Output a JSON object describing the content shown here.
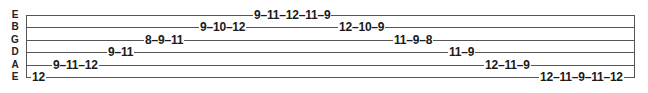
{
  "strings": [
    {
      "name": "E",
      "y": 15
    },
    {
      "name": "B",
      "y": 27
    },
    {
      "name": "G",
      "y": 40
    },
    {
      "name": "D",
      "y": 52
    },
    {
      "name": "A",
      "y": 65
    },
    {
      "name": "E",
      "y": 77
    }
  ],
  "phrases": [
    {
      "string": 5,
      "x": 31,
      "text": "12"
    },
    {
      "string": 4,
      "x": 52,
      "text": "9–11–12"
    },
    {
      "string": 3,
      "x": 107,
      "text": "9–11"
    },
    {
      "string": 2,
      "x": 144,
      "text": "8–9–11"
    },
    {
      "string": 1,
      "x": 199,
      "text": "9–10–12"
    },
    {
      "string": 0,
      "x": 253,
      "text": "9–11–12–11–9"
    },
    {
      "string": 1,
      "x": 338,
      "text": "12–10–9"
    },
    {
      "string": 2,
      "x": 393,
      "text": "11–9–8"
    },
    {
      "string": 3,
      "x": 448,
      "text": "11–9"
    },
    {
      "string": 4,
      "x": 484,
      "text": "12–11–9"
    },
    {
      "string": 5,
      "x": 539,
      "text": "12–11–9–11–12"
    }
  ]
}
